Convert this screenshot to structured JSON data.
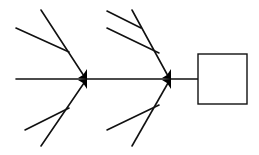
{
  "diagram": {
    "type": "fishbone",
    "colors": {
      "stroke": "#111111",
      "arrow": "#000000",
      "background": "#ffffff"
    },
    "spine": {
      "x1": 16,
      "y1": 79,
      "x2": 198,
      "y2": 79
    },
    "effect_box": {
      "x": 198,
      "y": 54,
      "width": 49,
      "height": 50,
      "label": ""
    },
    "joints": [
      {
        "id": "joint-1",
        "x": 87,
        "y": 79
      },
      {
        "id": "joint-2",
        "x": 171,
        "y": 79
      }
    ],
    "bones": [
      {
        "id": "bone-1-top-main",
        "x1": 41,
        "y1": 10,
        "x2": 84,
        "y2": 76
      },
      {
        "id": "bone-1-top-branch",
        "x1": 16,
        "y1": 28,
        "x2": 69,
        "y2": 52
      },
      {
        "id": "bone-1-bottom-main",
        "x1": 41,
        "y1": 146,
        "x2": 84,
        "y2": 83
      },
      {
        "id": "bone-1-bottom-branch",
        "x1": 25,
        "y1": 130,
        "x2": 69,
        "y2": 108
      },
      {
        "id": "bone-2-top-main",
        "x1": 132,
        "y1": 10,
        "x2": 168,
        "y2": 76
      },
      {
        "id": "bone-2-top-branch-a",
        "x1": 107,
        "y1": 11,
        "x2": 141,
        "y2": 28
      },
      {
        "id": "bone-2-top-branch-b",
        "x1": 107,
        "y1": 28,
        "x2": 159,
        "y2": 53
      },
      {
        "id": "bone-2-bottom-main",
        "x1": 132,
        "y1": 146,
        "x2": 168,
        "y2": 83
      },
      {
        "id": "bone-2-bottom-branch",
        "x1": 107,
        "y1": 130,
        "x2": 159,
        "y2": 105
      }
    ]
  }
}
